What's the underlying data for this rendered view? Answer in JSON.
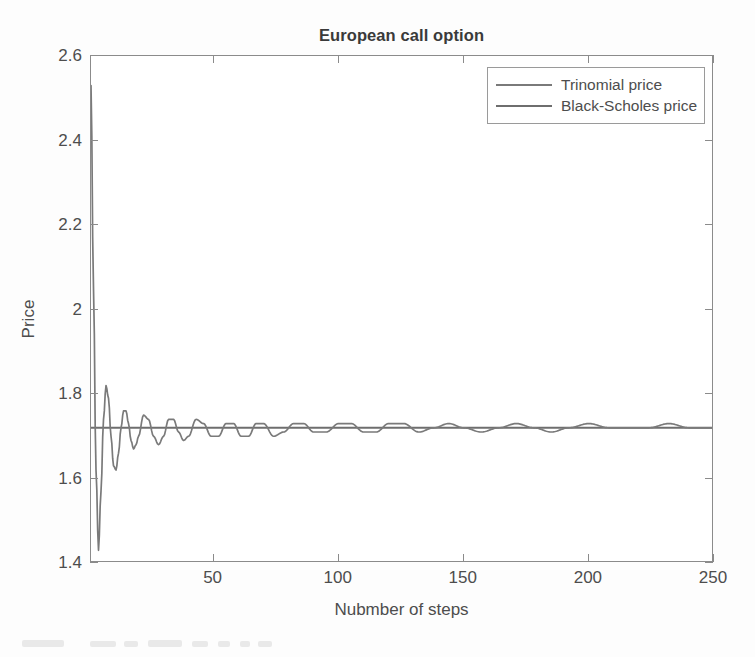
{
  "chart_data": {
    "type": "line",
    "title": "European call option",
    "xlabel": "Nubmber of steps",
    "ylabel": "Price",
    "xlim": [
      1,
      250
    ],
    "ylim": [
      1.4,
      2.6
    ],
    "xticks": [
      50,
      100,
      150,
      200,
      250
    ],
    "xtick_labels": [
      "50",
      "100",
      "150",
      "200",
      "250"
    ],
    "yticks": [
      1.4,
      1.6,
      1.8,
      2.0,
      2.2,
      2.4,
      2.6
    ],
    "ytick_labels": [
      "1.4",
      "1.6",
      "1.8",
      "2",
      "2.2",
      "2.4",
      "2.6"
    ],
    "grid": false,
    "legend_position": "upper right",
    "legend": [
      "Trinomial price",
      "Black-Scholes price"
    ],
    "series": [
      {
        "name": "Trinomial price",
        "color": "#7a7a7a",
        "x": [
          1,
          2,
          3,
          4,
          5,
          6,
          7,
          8,
          9,
          10,
          11,
          12,
          13,
          14,
          15,
          16,
          17,
          18,
          19,
          20,
          22,
          24,
          26,
          28,
          30,
          32,
          34,
          36,
          38,
          40,
          43,
          46,
          49,
          52,
          55,
          58,
          61,
          64,
          67,
          70,
          74,
          78,
          82,
          86,
          90,
          95,
          100,
          105,
          110,
          115,
          120,
          126,
          132,
          138,
          144,
          150,
          157,
          164,
          171,
          178,
          185,
          192,
          200,
          208,
          216,
          224,
          232,
          240,
          250
        ],
        "y": [
          2.53,
          2.05,
          1.62,
          1.43,
          1.57,
          1.74,
          1.82,
          1.79,
          1.7,
          1.63,
          1.62,
          1.66,
          1.72,
          1.76,
          1.76,
          1.73,
          1.69,
          1.67,
          1.68,
          1.7,
          1.75,
          1.74,
          1.7,
          1.68,
          1.7,
          1.74,
          1.74,
          1.71,
          1.69,
          1.7,
          1.74,
          1.73,
          1.7,
          1.7,
          1.73,
          1.73,
          1.7,
          1.7,
          1.73,
          1.73,
          1.7,
          1.71,
          1.73,
          1.73,
          1.71,
          1.71,
          1.73,
          1.73,
          1.71,
          1.71,
          1.73,
          1.73,
          1.71,
          1.72,
          1.73,
          1.72,
          1.71,
          1.72,
          1.73,
          1.72,
          1.71,
          1.72,
          1.73,
          1.72,
          1.72,
          1.72,
          1.73,
          1.72,
          1.72
        ]
      },
      {
        "name": "Black-Scholes price",
        "color": "#6e6e6e",
        "x": [
          1,
          250
        ],
        "y": [
          1.72,
          1.72
        ]
      }
    ],
    "converged_value": 1.72
  },
  "axes": {
    "title": "European call option",
    "xlabel": "Nubmber of steps",
    "ylabel": "Price"
  },
  "legend": {
    "items": [
      {
        "label": "Trinomial price"
      },
      {
        "label": "Black-Scholes price"
      }
    ]
  },
  "colors": {
    "trinomial": "#7a7a7a",
    "black_scholes": "#6e6e6e",
    "axis": "#8b8b8b",
    "text": "#4d4d4d",
    "background": "#ffffff"
  }
}
